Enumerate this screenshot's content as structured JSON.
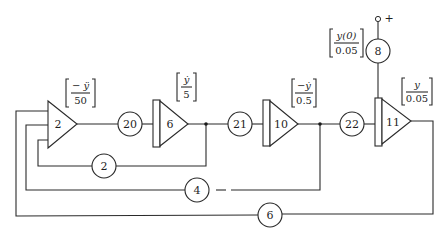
{
  "diagram": {
    "type": "analog computer block diagram",
    "amplifiers": [
      {
        "id": "amp-2",
        "label": "2",
        "kind": "summer",
        "output_annotation": {
          "numerator": "− ÿ",
          "denominator": "50"
        }
      },
      {
        "id": "amp-6",
        "label": "6",
        "kind": "integrator",
        "output_annotation": {
          "numerator": "ẏ",
          "denominator": "5"
        }
      },
      {
        "id": "amp-10",
        "label": "10",
        "kind": "integrator",
        "output_annotation": {
          "numerator": "−ẏ",
          "denominator": "0.5"
        }
      },
      {
        "id": "amp-11",
        "label": "11",
        "kind": "integrator",
        "output_annotation": {
          "numerator": "y",
          "denominator": "0.05"
        }
      }
    ],
    "potentiometers": [
      {
        "id": "pot-20",
        "label": "20"
      },
      {
        "id": "pot-21",
        "label": "21"
      },
      {
        "id": "pot-22",
        "label": "22"
      },
      {
        "id": "pot-8",
        "label": "8",
        "annotation": {
          "numerator": "y(0)",
          "denominator": "0.05"
        }
      },
      {
        "id": "pot-2",
        "label": "2"
      },
      {
        "id": "pot-4",
        "label": "4"
      },
      {
        "id": "pot-6",
        "label": "6"
      }
    ],
    "supply_terminal": "+",
    "connections": [
      "amp-2 -> pot-20 -> amp-6",
      "amp-6 -> pot-21 -> amp-10",
      "amp-10 -> pot-22 -> amp-11",
      "+ -> pot-8 -> amp-11 (initial condition)",
      "amp-6 output -> pot-2 -> amp-2 input",
      "amp-10 output -> pot-4 -> amp-2 input",
      "amp-11 output -> pot-6 -> amp-2 input"
    ]
  }
}
